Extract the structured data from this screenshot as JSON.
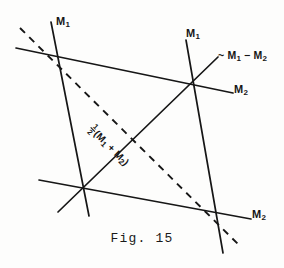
{
  "figure": {
    "caption": "Fig. 15",
    "background_color": "#fdfdfc",
    "ink_color": "#161616",
    "width": 284,
    "height": 268,
    "labels": {
      "m1_topleft": "M",
      "m1_topleft_sub": "1",
      "m1_topright": "M",
      "m1_topright_sub": "1",
      "m2_right": "M",
      "m2_right_sub": "2",
      "m2_bottomright": "M",
      "m2_bottomright_sub": "2",
      "difference_prefix": "~ M",
      "difference_sub1": "1",
      "difference_minus": " − M",
      "difference_sub2": "2",
      "midpoint_numerator": "1",
      "midpoint_denominator": "2",
      "midpoint_open": "(M",
      "midpoint_sub1": "1",
      "midpoint_plus": " + M",
      "midpoint_sub2": "2",
      "midpoint_close": ")"
    }
  },
  "geometry": {
    "line_color": "#161616",
    "solid_width": 1.7,
    "dashed_width": 1.9,
    "dash_pattern": "7 6",
    "intersections": [
      {
        "name": "upper-left",
        "x": 62,
        "y": 58
      },
      {
        "name": "upper-right",
        "x": 190,
        "y": 85
      },
      {
        "name": "lower-left",
        "x": 82,
        "y": 190
      },
      {
        "name": "lower-right",
        "x": 218,
        "y": 215
      }
    ],
    "lines": [
      {
        "name": "m1-left-steep",
        "x1": 51,
        "y1": 22,
        "x2": 89,
        "y2": 216,
        "style": "solid"
      },
      {
        "name": "m1-right-steep",
        "x1": 186,
        "y1": 40,
        "x2": 223,
        "y2": 253,
        "style": "solid"
      },
      {
        "name": "m2-upper-shallow",
        "x1": 16,
        "y1": 48,
        "x2": 233,
        "y2": 93,
        "style": "solid"
      },
      {
        "name": "m2-lower-shallow",
        "x1": 39,
        "y1": 180,
        "x2": 251,
        "y2": 219,
        "style": "solid"
      },
      {
        "name": "midpoint-diagonal",
        "x1": 58,
        "y1": 212,
        "x2": 218,
        "y2": 57,
        "style": "solid"
      },
      {
        "name": "difference-diagonal",
        "x1": 20,
        "y1": 28,
        "x2": 241,
        "y2": 247,
        "style": "dashed"
      }
    ]
  }
}
